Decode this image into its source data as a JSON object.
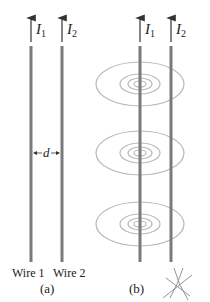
{
  "figure": {
    "panel_a": {
      "label": "(a)",
      "wires": [
        {
          "name": "Wire 1",
          "current_symbol": "I",
          "current_subscript": "1",
          "direction": "up"
        },
        {
          "name": "Wire 2",
          "current_symbol": "I",
          "current_subscript": "2",
          "direction": "up"
        }
      ],
      "separation_label": "d"
    },
    "panel_b": {
      "label": "(b)",
      "wires": [
        {
          "current_symbol": "I",
          "current_subscript": "1",
          "direction": "up"
        },
        {
          "current_symbol": "I",
          "current_subscript": "2",
          "direction": "up"
        }
      ],
      "field_loops": {
        "centered_on": "wire 1",
        "groups": 3,
        "rings_per_group": 4
      },
      "annotation": "compass-cross-mark"
    },
    "colors": {
      "wire": "#7a7a7a",
      "field_line": "#b9b9b9",
      "arrow": "#333333",
      "text": "#222222"
    }
  }
}
